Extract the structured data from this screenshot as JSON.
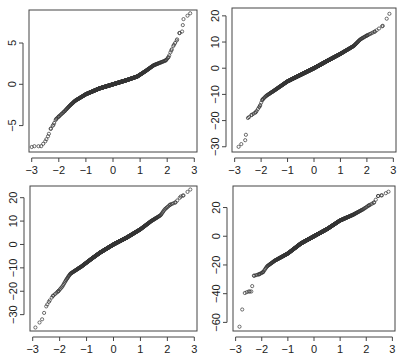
{
  "figure": {
    "layout": "2x2",
    "point_color": "#333333",
    "axis_color": "#444444",
    "background": "#ffffff"
  },
  "chart_data": [
    {
      "type": "scatter",
      "subtype": "qq-plot",
      "position": "top-left",
      "title": "",
      "xlabel": "",
      "ylabel": "",
      "xlim": [
        -3.1,
        3.1
      ],
      "ylim": [
        -8.2,
        9.0
      ],
      "xticks": [
        -3,
        -2,
        -1,
        0,
        1,
        2,
        3
      ],
      "yticks": [
        -5,
        0,
        5
      ],
      "ytick_labels": [
        "−5",
        "0",
        "5"
      ],
      "xtick_labels": [
        "−3",
        "−2",
        "−1",
        "0",
        "1",
        "2",
        "3"
      ],
      "box": {
        "x": 29,
        "y": 10,
        "w": 168,
        "h": 142
      },
      "curve": [
        [
          -3.0,
          -7.6
        ],
        [
          -2.9,
          -7.5
        ],
        [
          -2.65,
          -7.5
        ],
        [
          -2.5,
          -6.9
        ],
        [
          -2.4,
          -6.3
        ],
        [
          -2.3,
          -5.4
        ],
        [
          -2.2,
          -4.9
        ],
        [
          -2.1,
          -4.2
        ],
        [
          -2.0,
          -3.9
        ],
        [
          -1.8,
          -3.3
        ],
        [
          -1.6,
          -2.6
        ],
        [
          -1.4,
          -2.0
        ],
        [
          -1.0,
          -1.2
        ],
        [
          -0.5,
          -0.5
        ],
        [
          0,
          0
        ],
        [
          0.5,
          0.5
        ],
        [
          0.9,
          0.95
        ],
        [
          1.2,
          1.6
        ],
        [
          1.5,
          2.3
        ],
        [
          1.8,
          2.7
        ],
        [
          1.95,
          2.9
        ],
        [
          2.05,
          3.3
        ],
        [
          2.15,
          4.1
        ],
        [
          2.25,
          4.8
        ],
        [
          2.35,
          5.3
        ],
        [
          2.45,
          6.2
        ],
        [
          2.55,
          6.4
        ],
        [
          2.6,
          7.9
        ],
        [
          2.85,
          8.6
        ]
      ]
    },
    {
      "type": "scatter",
      "subtype": "qq-plot",
      "position": "top-right",
      "title": "",
      "xlabel": "",
      "ylabel": "",
      "xlim": [
        -3.1,
        3.1
      ],
      "ylim": [
        -32,
        23
      ],
      "xticks": [
        -3,
        -2,
        -1,
        0,
        1,
        2,
        3
      ],
      "yticks": [
        -30,
        -20,
        -10,
        0,
        10,
        20
      ],
      "ytick_labels": [
        "−30",
        "−20",
        "−10",
        "0",
        "10",
        "20"
      ],
      "xtick_labels": [
        "−3",
        "−2",
        "−1",
        "0",
        "1",
        "2",
        "3"
      ],
      "box": {
        "x": 232,
        "y": 8,
        "w": 164,
        "h": 144
      },
      "curve": [
        [
          -2.85,
          -30
        ],
        [
          -2.6,
          -27.5
        ],
        [
          -2.5,
          -19
        ],
        [
          -2.35,
          -17.8
        ],
        [
          -2.2,
          -16.8
        ],
        [
          -2.05,
          -14.5
        ],
        [
          -1.95,
          -12
        ],
        [
          -1.8,
          -10.5
        ],
        [
          -1.5,
          -8.5
        ],
        [
          -1.0,
          -5
        ],
        [
          -0.5,
          -2.5
        ],
        [
          0,
          0
        ],
        [
          0.5,
          2.8
        ],
        [
          1.0,
          5.5
        ],
        [
          1.5,
          8.5
        ],
        [
          1.75,
          11
        ],
        [
          2.0,
          12.5
        ],
        [
          2.3,
          14
        ],
        [
          2.6,
          16.2
        ],
        [
          2.85,
          20.8
        ]
      ]
    },
    {
      "type": "scatter",
      "subtype": "qq-plot",
      "position": "bottom-left",
      "title": "",
      "xlabel": "",
      "ylabel": "",
      "xlim": [
        -3.1,
        3.1
      ],
      "ylim": [
        -37,
        25
      ],
      "xticks": [
        -3,
        -2,
        -1,
        0,
        1,
        2,
        3
      ],
      "yticks": [
        -30,
        -20,
        -10,
        0,
        10,
        20
      ],
      "ytick_labels": [
        "−30",
        "−20",
        "−10",
        "0",
        "10",
        "20"
      ],
      "xtick_labels": [
        "−3",
        "−2",
        "−1",
        "0",
        "1",
        "2",
        "3"
      ],
      "box": {
        "x": 30,
        "y": 186,
        "w": 167,
        "h": 145
      },
      "curve": [
        [
          -2.9,
          -35.5
        ],
        [
          -2.65,
          -32
        ],
        [
          -2.5,
          -26.5
        ],
        [
          -2.4,
          -24.5
        ],
        [
          -2.25,
          -22
        ],
        [
          -2.05,
          -20
        ],
        [
          -1.9,
          -18
        ],
        [
          -1.75,
          -15
        ],
        [
          -1.6,
          -12.5
        ],
        [
          -1.2,
          -9.5
        ],
        [
          -0.8,
          -6
        ],
        [
          -0.5,
          -3.5
        ],
        [
          0,
          0
        ],
        [
          0.5,
          3
        ],
        [
          1.0,
          6.5
        ],
        [
          1.4,
          10
        ],
        [
          1.75,
          12.5
        ],
        [
          1.9,
          15
        ],
        [
          2.1,
          17
        ],
        [
          2.3,
          18
        ],
        [
          2.5,
          20.5
        ],
        [
          2.6,
          21
        ],
        [
          2.85,
          23.5
        ]
      ]
    },
    {
      "type": "scatter",
      "subtype": "qq-plot",
      "position": "bottom-right",
      "title": "",
      "xlabel": "",
      "ylabel": "",
      "xlim": [
        -3.1,
        3.1
      ],
      "ylim": [
        -66,
        35
      ],
      "xticks": [
        -3,
        -2,
        -1,
        0,
        1,
        2,
        3
      ],
      "yticks": [
        -60,
        -40,
        -20,
        0,
        20
      ],
      "ytick_labels": [
        "−60",
        "−40",
        "−20",
        "0",
        "20"
      ],
      "xtick_labels": [
        "−3",
        "−2",
        "−1",
        "0",
        "1",
        "2",
        "3"
      ],
      "box": {
        "x": 233,
        "y": 186,
        "w": 162,
        "h": 145
      },
      "curve": [
        [
          -2.85,
          -63
        ],
        [
          -2.65,
          -39.5
        ],
        [
          -2.5,
          -38.5
        ],
        [
          -2.4,
          -38.5
        ],
        [
          -2.3,
          -27.5
        ],
        [
          -2.1,
          -26.5
        ],
        [
          -1.95,
          -25
        ],
        [
          -1.8,
          -21
        ],
        [
          -1.5,
          -17
        ],
        [
          -1.0,
          -12
        ],
        [
          -0.5,
          -5
        ],
        [
          0,
          0
        ],
        [
          0.5,
          5
        ],
        [
          1.0,
          11
        ],
        [
          1.5,
          15
        ],
        [
          1.9,
          19
        ],
        [
          2.1,
          21.5
        ],
        [
          2.3,
          23.5
        ],
        [
          2.45,
          28
        ],
        [
          2.6,
          28.5
        ],
        [
          2.85,
          31
        ]
      ]
    }
  ]
}
